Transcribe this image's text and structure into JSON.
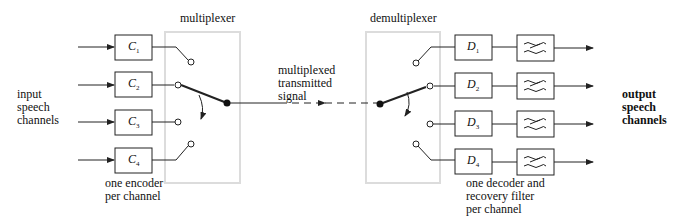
{
  "diagram": {
    "labels": {
      "input": [
        "input",
        "speech",
        "channels"
      ],
      "multiplexer": "multiplexer",
      "demultiplexer": "demultiplexer",
      "transmitted": [
        "multiplexed",
        "transmitted",
        "signal"
      ],
      "output": [
        "output",
        "speech",
        "channels"
      ],
      "encoder_note": [
        "one encoder",
        "per channel"
      ],
      "decoder_note": [
        "one decoder and",
        "recovery filter",
        "per channel"
      ]
    },
    "encoders": [
      {
        "letter": "C",
        "sub": "1"
      },
      {
        "letter": "C",
        "sub": "2"
      },
      {
        "letter": "C",
        "sub": "3"
      },
      {
        "letter": "C",
        "sub": "4"
      }
    ],
    "decoders": [
      {
        "letter": "D",
        "sub": "1"
      },
      {
        "letter": "D",
        "sub": "2"
      },
      {
        "letter": "D",
        "sub": "3"
      },
      {
        "letter": "D",
        "sub": "4"
      }
    ],
    "filters": [
      "low-pass-filter",
      "low-pass-filter",
      "low-pass-filter",
      "low-pass-filter"
    ],
    "colors": {
      "line": "#222222",
      "switch_box_border": "#dcdcdc"
    }
  }
}
